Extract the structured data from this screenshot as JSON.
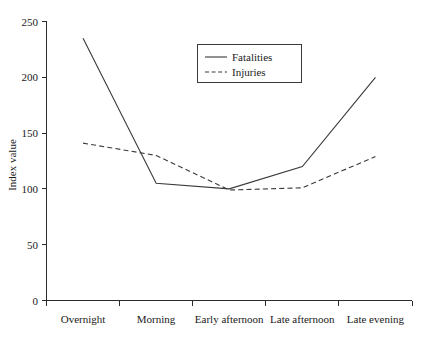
{
  "chart_data": {
    "type": "line",
    "title": "",
    "xlabel": "",
    "ylabel": "Index value",
    "categories": [
      "Overnight",
      "Morning",
      "Early afternoon",
      "Late afternoon",
      "Late evening"
    ],
    "series": [
      {
        "name": "Fatalities",
        "style": "solid",
        "values": [
          235,
          105,
          100,
          120,
          200
        ]
      },
      {
        "name": "Injuries",
        "style": "dashed",
        "values": [
          141,
          130,
          99,
          101,
          129
        ]
      }
    ],
    "ylim": [
      0,
      250
    ],
    "yticks": [
      0,
      50,
      100,
      150,
      200,
      250
    ],
    "ytick_labels": [
      "0",
      "50",
      "100",
      "150",
      "200",
      "250"
    ],
    "grid": false,
    "legend_position": "upper center",
    "line_color": "#3a3a3a",
    "axis_color": "#2b2b2b",
    "background": "#ffffff"
  },
  "legend": {
    "entries": [
      {
        "label": "Fatalities"
      },
      {
        "label": "Injuries"
      }
    ]
  },
  "axes": {
    "y_title": "Index value"
  }
}
